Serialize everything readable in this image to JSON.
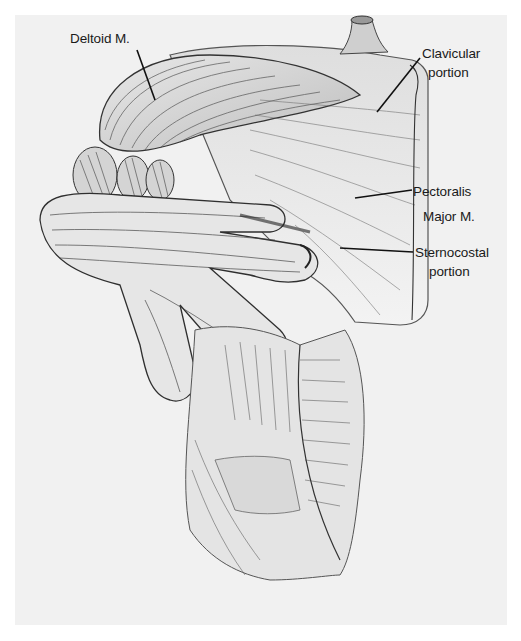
{
  "figure": {
    "background_color": "#f1f1f1",
    "ink_color": "#1a1a1a"
  },
  "labels": {
    "deltoid": {
      "text": "Deltoid M."
    },
    "clavicular": {
      "line1": "Clavicular",
      "line2": "portion"
    },
    "pectoralis": {
      "line1": "Pectoralis",
      "line2": "Major M."
    },
    "sternocostal": {
      "line1": "Sternocostal",
      "line2": "portion"
    }
  }
}
